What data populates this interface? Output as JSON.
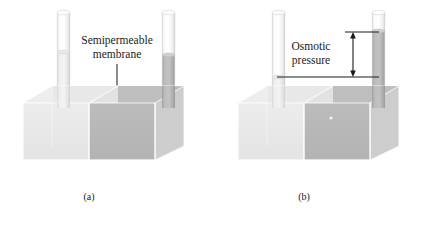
{
  "figure": {
    "background_color": "#ffffff"
  },
  "colors": {
    "solvent_front": "#e9e9e9",
    "solvent_side": "#f2f2f2",
    "solvent_top": "#ededed",
    "solvent_floor": "#d8d8d8",
    "solution_front": "#b9b9b9",
    "solution_top": "#c6c6c6",
    "solution_side": "#cfcfcf",
    "solution_floor": "#a9a9a9",
    "tube_glass": "#f6f6f6",
    "tube_glass_edge": "#dcdcdc",
    "tube_solvent": "#e4e4e4",
    "tube_solution": "#b4b4b4",
    "line_dark": "#1a1a1a",
    "edge_light": "#ffffff",
    "text": "#1a1a1a"
  },
  "panels": [
    {
      "id": "a",
      "caption": "(a)",
      "annotation": {
        "line1": "Semipermeable",
        "line2": "membrane"
      },
      "left_tube": {
        "liquid": "solvent",
        "level_label": "equal"
      },
      "right_tube": {
        "liquid": "solution",
        "level_label": "equal"
      }
    },
    {
      "id": "b",
      "caption": "(b)",
      "annotation": {
        "line1": "Osmotic",
        "line2": "pressure"
      },
      "left_tube": {
        "liquid": "solvent",
        "level_label": "lowered"
      },
      "right_tube": {
        "liquid": "solution",
        "level_label": "raised"
      },
      "measurement": {
        "arrow_type": "double-headed-vertical"
      }
    }
  ]
}
